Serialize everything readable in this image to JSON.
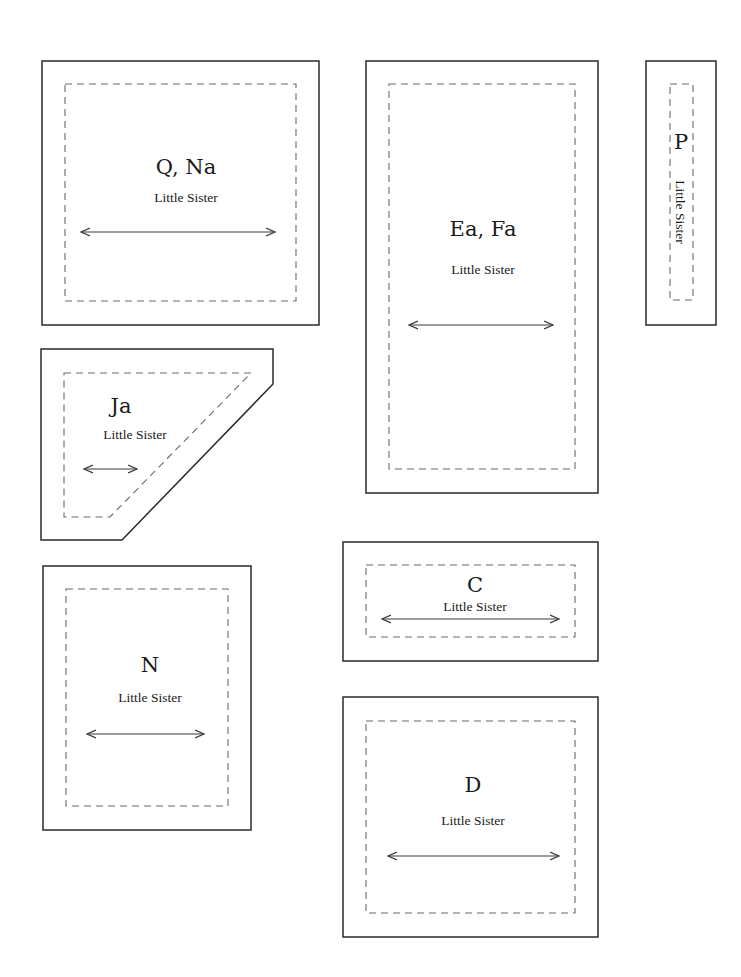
{
  "sheet": {
    "pieces": [
      {
        "id": "q-na",
        "label": "Q, Na",
        "sublabel": "Little Sister",
        "shape": "rectangle",
        "grain_arrow": "horizontal"
      },
      {
        "id": "ea-fa",
        "label": "Ea, Fa",
        "sublabel": "Little Sister",
        "shape": "rectangle",
        "grain_arrow": "horizontal"
      },
      {
        "id": "p",
        "label": "P",
        "sublabel": "Little Sister",
        "shape": "rectangle",
        "sublabel_orientation": "vertical"
      },
      {
        "id": "ja",
        "label": "Ja",
        "sublabel": "Little Sister",
        "shape": "trapezoid",
        "grain_arrow": "horizontal"
      },
      {
        "id": "c",
        "label": "C",
        "sublabel": "Little Sister",
        "shape": "rectangle",
        "grain_arrow": "horizontal"
      },
      {
        "id": "n",
        "label": "N",
        "sublabel": "Little Sister",
        "shape": "rectangle",
        "grain_arrow": "horizontal"
      },
      {
        "id": "d",
        "label": "D",
        "sublabel": "Little Sister",
        "shape": "rectangle",
        "grain_arrow": "horizontal"
      }
    ],
    "colors": {
      "cut_line": "#2a2a2a",
      "seam_line": "#6a6a6a",
      "background": "#ffffff"
    }
  }
}
